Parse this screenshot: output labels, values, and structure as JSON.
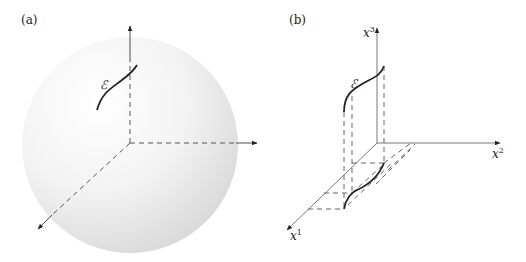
{
  "panels": [
    {
      "label": "(a)",
      "description": "sphere with three coordinate axes and a curve",
      "curve_label": "ℰ"
    },
    {
      "label": "(b)",
      "description": "3D coordinate axes with a curve and its projection onto the x1-x2 plane",
      "curve_label": "ℰ",
      "axes": {
        "x1": {
          "base": "x",
          "sup": "1"
        },
        "x2": {
          "base": "x",
          "sup": "2"
        },
        "x3": {
          "base": "x",
          "sup": "3"
        }
      }
    }
  ],
  "colors": {
    "line": "#222222",
    "dash": "#555555",
    "sphere_light": "#ffffff",
    "sphere_dark": "#dcdcdc"
  }
}
